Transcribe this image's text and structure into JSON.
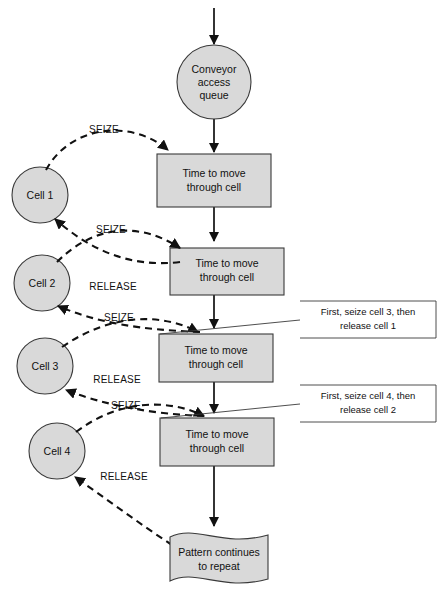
{
  "diagram": {
    "colors": {
      "node_fill": "#d9d9d9",
      "node_stroke": "#3a3a3a",
      "line": "#111111",
      "note_fill": "#ffffff",
      "background": "#ffffff"
    },
    "start_node": {
      "shape": "circle",
      "lines": [
        "Conveyor",
        "access",
        "queue"
      ]
    },
    "process_nodes": [
      {
        "shape": "rectangle",
        "lines": [
          "Time to move",
          "through cell"
        ]
      },
      {
        "shape": "rectangle",
        "lines": [
          "Time to move",
          "through cell"
        ]
      },
      {
        "shape": "rectangle",
        "lines": [
          "Time to move",
          "through cell"
        ]
      },
      {
        "shape": "rectangle",
        "lines": [
          "Time to move",
          "through cell"
        ]
      }
    ],
    "cells": [
      {
        "label": "Cell 1",
        "shape": "circle"
      },
      {
        "label": "Cell 2",
        "shape": "circle"
      },
      {
        "label": "Cell 3",
        "shape": "circle"
      },
      {
        "label": "Cell 4",
        "shape": "circle"
      }
    ],
    "edge_labels": {
      "seize": "SEIZE",
      "release": "RELEASE"
    },
    "edges": [
      {
        "label": "SEIZE",
        "from": "Cell 1",
        "to": "Time to move through cell 1"
      },
      {
        "label": "SEIZE",
        "from": "Cell 2",
        "to": "Time to move through cell 2"
      },
      {
        "label": "RELEASE",
        "from": "Time to move through cell 2",
        "to": "Cell 1"
      },
      {
        "label": "SEIZE",
        "from": "Cell 3",
        "to": "Time to move through cell 3"
      },
      {
        "label": "RELEASE",
        "from": "Time to move through cell 3",
        "to": "Cell 2"
      },
      {
        "label": "SEIZE",
        "from": "Cell 4",
        "to": "Time to move through cell 4"
      },
      {
        "label": "RELEASE",
        "from": "Time to move through cell 4",
        "to": "Cell 3"
      },
      {
        "label": "RELEASE",
        "from": "Pattern continues to repeat",
        "to": "Cell 4"
      }
    ],
    "annotations": [
      {
        "lines": [
          "First, seize cell  3, then",
          "release cell 1"
        ],
        "target": "Time to move through cell 3"
      },
      {
        "lines": [
          "First, seize cell  4, then",
          "release cell 2"
        ],
        "target": "Time to move through cell 4"
      }
    ],
    "end_node": {
      "shape": "banner",
      "lines": [
        "Pattern continues",
        "to repeat"
      ]
    }
  }
}
